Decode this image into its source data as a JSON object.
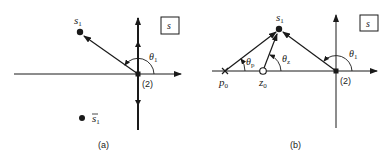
{
  "panel_a": {
    "caption": "(a)",
    "plane_label": "s",
    "point_label": "s",
    "point_sub": "1",
    "conj_label": "s",
    "conj_sub": "1",
    "angle_label": "θ",
    "angle_sub": "1",
    "multiplicity": "(2)"
  },
  "panel_b": {
    "caption": "(b)",
    "plane_label": "s",
    "point_label": "s",
    "point_sub": "1",
    "pole_label": "p",
    "pole_sub": "0",
    "zero_label": "z",
    "zero_sub": "0",
    "theta_p_label": "θ",
    "theta_p_sub": "p",
    "theta_z_label": "θ",
    "theta_z_sub": "z",
    "theta_1_label": "θ",
    "theta_1_sub": "1",
    "multiplicity": "(2)"
  },
  "colors": {
    "ink": "#1a1a1a",
    "background": "#ffffff"
  }
}
